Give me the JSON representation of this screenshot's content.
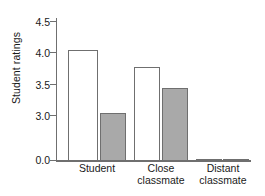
{
  "chart_data": {
    "type": "bar",
    "title": "",
    "subtitle": "",
    "xlabel": "",
    "ylabel": "Student ratings",
    "categories": [
      "Student",
      "Close classmate",
      "Distant classmate"
    ],
    "category_lines": [
      [
        "Student"
      ],
      [
        "Close",
        "classmate"
      ],
      [
        "Distant",
        "classmate"
      ]
    ],
    "series": [
      {
        "name": "open-bar-series",
        "fill": "#ffffff",
        "values": [
          4.05,
          3.78,
          0.12
        ]
      },
      {
        "name": "filled-bar-series",
        "fill": "#a9a9a9",
        "values": [
          3.05,
          3.45,
          0.25
        ]
      }
    ],
    "ytick_labels": [
      "4.5",
      "4.0",
      "3.5",
      "3.0",
      "0.0"
    ],
    "ytick_values": [
      4.5,
      4.0,
      3.5,
      3.0,
      0.0
    ],
    "ylim": [
      0.0,
      4.75
    ],
    "axis_break": true,
    "axis_break_between": [
      0.0,
      3.0
    ],
    "grid": false,
    "legend": "none",
    "annotations": []
  },
  "axis": {
    "line_color": "#6f6f6f",
    "text_color": "#1a1a1a"
  }
}
